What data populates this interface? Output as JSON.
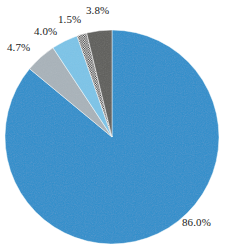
{
  "chart_data": {
    "type": "pie",
    "title": "",
    "xlabel": "",
    "ylabel": "",
    "legend": "none",
    "grid": false,
    "start_angle_deg": -90,
    "direction": "clockwise",
    "center": [
      112,
      137
    ],
    "radius": 107,
    "categories": [
      "Category 1",
      "Category 2",
      "Category 3",
      "Category 4",
      "Category 5"
    ],
    "values": [
      86.0,
      4.7,
      4.0,
      1.5,
      3.8
    ],
    "labels": [
      "86.0%",
      "4.7%",
      "4.0%",
      "1.5%",
      "3.8%"
    ],
    "colors": [
      "#2e8fcc",
      "#a9b3ba",
      "#7cc4e8",
      "#ffffff",
      "#5e5e5c"
    ],
    "slices": [
      {
        "label": "86.0%",
        "value": 86.0,
        "color": "#2e8fcc",
        "fill_style": "solid",
        "label_position": "outside-bottom-right"
      },
      {
        "label": "4.7%",
        "value": 4.7,
        "color": "#a9b3ba",
        "fill_style": "solid",
        "label_position": "outside-upper-left"
      },
      {
        "label": "4.0%",
        "value": 4.0,
        "color": "#7cc4e8",
        "fill_style": "solid",
        "label_position": "outside-upper-left"
      },
      {
        "label": "1.5%",
        "value": 1.5,
        "color": "#ffffff",
        "fill_style": "checkered",
        "label_position": "outside-top"
      },
      {
        "label": "3.8%",
        "value": 3.8,
        "color": "#5e5e5c",
        "fill_style": "solid",
        "label_position": "outside-top"
      }
    ]
  },
  "labels": {
    "l0": "4.7%",
    "l1": "4.0%",
    "l2": "1.5%",
    "l3": "3.8%",
    "l4": "86.0%"
  }
}
